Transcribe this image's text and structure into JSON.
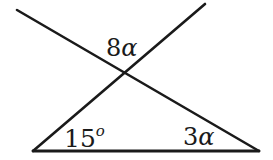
{
  "diagram": {
    "type": "geometry-angles",
    "stroke_color": "#1a1a1a",
    "lines": [
      {
        "name": "line-descending",
        "x1": 17,
        "y1": 10,
        "x2": 259,
        "y2": 151
      },
      {
        "name": "line-ascending",
        "x1": 33,
        "y1": 151,
        "x2": 205,
        "y2": 4
      },
      {
        "name": "base-line",
        "x1": 33,
        "y1": 151,
        "x2": 259,
        "y2": 151
      }
    ],
    "intersection": {
      "x": 126,
      "y": 73
    },
    "labels": {
      "top_angle": {
        "coef": "8",
        "var": "α"
      },
      "left_angle": {
        "value": "15",
        "unit": "o"
      },
      "right_angle": {
        "coef": "3",
        "var": "α"
      }
    }
  }
}
